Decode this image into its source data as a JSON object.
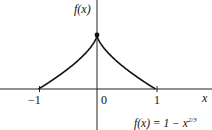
{
  "chart_data": {
    "type": "line",
    "title": "",
    "function": "f(x) = 1 - x^{2/3}",
    "xlabel": "x",
    "ylabel": "f(x)",
    "x_ticks": [
      "-1",
      "0",
      "1"
    ],
    "xlim": [
      -1.5,
      1.8
    ],
    "ylim": [
      -0.6,
      1.45
    ],
    "grid": false,
    "annotations": [
      "f(x) = 1 − x^2/3"
    ],
    "points": [
      {
        "x": -1,
        "y": 0
      },
      {
        "x": -0.75,
        "y": 0.17
      },
      {
        "x": -0.5,
        "y": 0.37
      },
      {
        "x": -0.25,
        "y": 0.6
      },
      {
        "x": 0,
        "y": 1
      },
      {
        "x": 0.25,
        "y": 0.6
      },
      {
        "x": 0.5,
        "y": 0.37
      },
      {
        "x": 0.75,
        "y": 0.17
      },
      {
        "x": 1,
        "y": 0
      }
    ],
    "marked_point": {
      "x": 0,
      "y": 1
    }
  },
  "labels": {
    "y_axis": "f(x)",
    "x_axis": "x",
    "tick_neg1": "−1",
    "tick_0": "0",
    "tick_1": "1",
    "formula_lhs": "f(x) = 1 − x",
    "formula_exp": "2/3"
  }
}
